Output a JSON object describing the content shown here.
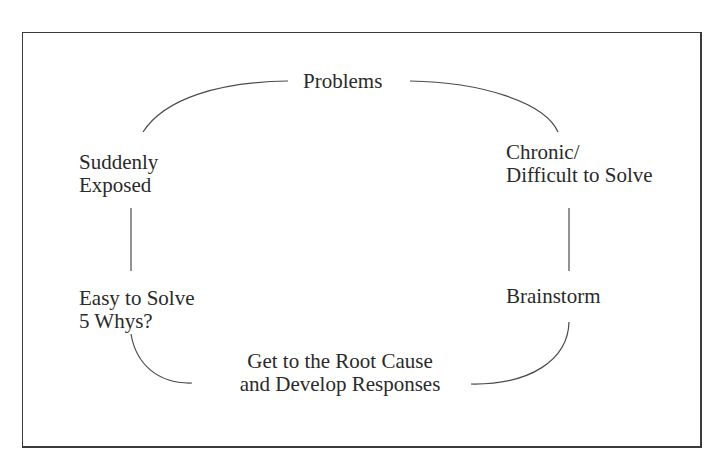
{
  "diagram": {
    "type": "cycle",
    "nodes": {
      "problems": {
        "lines": [
          "Problems"
        ]
      },
      "suddenly_exposed": {
        "lines": [
          "Suddenly",
          "Exposed"
        ]
      },
      "chronic": {
        "lines": [
          "Chronic/",
          "Difficult to Solve"
        ]
      },
      "easy_to_solve": {
        "lines": [
          "Easy to Solve",
          "5 Whys?"
        ]
      },
      "brainstorm": {
        "lines": [
          "Brainstorm"
        ]
      },
      "root_cause": {
        "lines": [
          "Get to the Root Cause",
          "and Develop Responses"
        ]
      }
    },
    "edges": [
      {
        "from": "problems",
        "to": "suddenly_exposed"
      },
      {
        "from": "problems",
        "to": "chronic"
      },
      {
        "from": "suddenly_exposed",
        "to": "easy_to_solve"
      },
      {
        "from": "chronic",
        "to": "brainstorm"
      },
      {
        "from": "easy_to_solve",
        "to": "root_cause"
      },
      {
        "from": "brainstorm",
        "to": "root_cause"
      }
    ],
    "colors": {
      "line": "#4a4a4a",
      "text": "#2a2a2a",
      "frame": "#3a3a3a",
      "background": "#ffffff"
    }
  }
}
